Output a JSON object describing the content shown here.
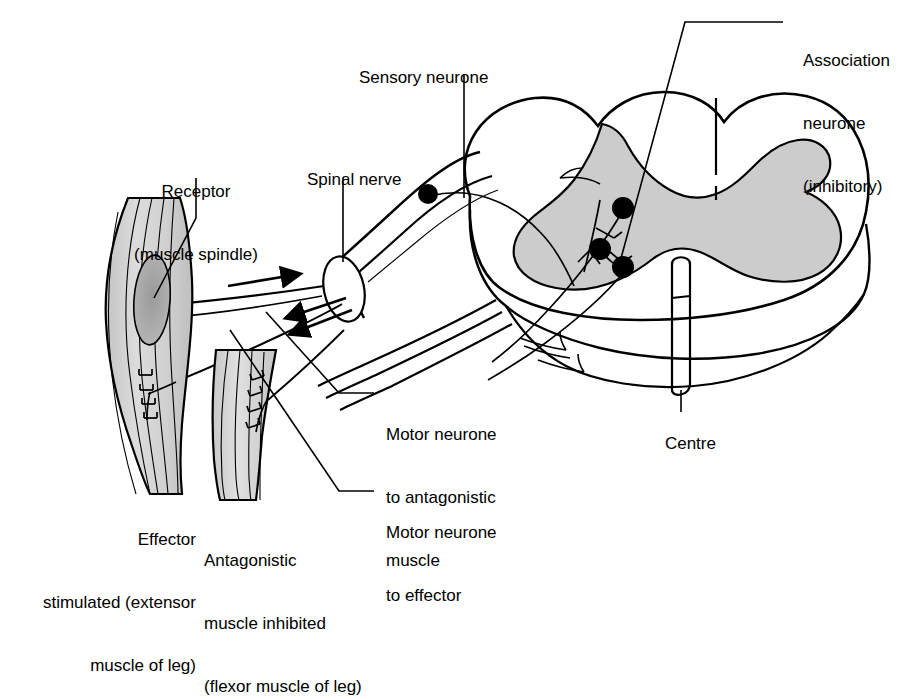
{
  "figure": {
    "background_color": "#ffffff",
    "ink_color": "#000000",
    "grey_matter_color": "#cccccc",
    "muscle_fill_color": "#d4d4d4",
    "spindle_fill_color": "#a8a8a8"
  },
  "labels": {
    "sensory_neurone": "Sensory neurone",
    "association_neurone_line1": "Association",
    "association_neurone_line2": "neurone",
    "association_neurone_line3": "(inhibitory)",
    "receptor_line1": "Receptor",
    "receptor_line2": "(muscle spindle)",
    "spinal_nerve": "Spinal nerve",
    "centre": "Centre",
    "motor_antagonistic_line1": "Motor neurone",
    "motor_antagonistic_line2": "to antagonistic",
    "motor_antagonistic_line3": "muscle",
    "motor_effector_line1": "Motor neurone",
    "motor_effector_line2": "to effector",
    "effector_line1": "Effector",
    "effector_line2": "stimulated (extensor",
    "effector_line3": "muscle of leg)",
    "antagonistic_line1": "Antagonistic",
    "antagonistic_line2": "muscle inhibited",
    "antagonistic_line3": "(flexor muscle of leg)"
  },
  "parts": {
    "sensory_cell_body": "sensory-neurone-cell-body",
    "association_cell_body": "association-neurone-cell-body",
    "motor_cell_body_upper": "motor-neurone-cell-body-upper",
    "motor_cell_body_lower": "motor-neurone-cell-body-lower",
    "spinal_nerve_ellipse": "spinal-nerve-cross-section",
    "impulse_arrow_in": "afferent-impulse-arrow",
    "impulse_arrow_out_upper": "efferent-impulse-arrow-upper",
    "impulse_arrow_out_lower": "efferent-impulse-arrow-lower",
    "extensor_muscle": "extensor-muscle-body",
    "flexor_muscle": "flexor-muscle-body",
    "muscle_spindle": "muscle-spindle-organ",
    "motor_end_plate_extensor": "motor-end-plate-extensor",
    "motor_end_plate_flexor": "motor-end-plate-flexor",
    "central_canal": "central-canal",
    "grey_matter": "grey-matter-butterfly",
    "white_matter": "white-matter-outline"
  }
}
